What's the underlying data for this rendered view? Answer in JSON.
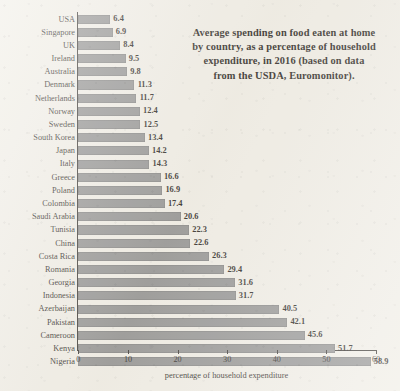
{
  "chart_data": {
    "type": "bar",
    "orientation": "horizontal",
    "title_lines": [
      "Average spending on food eaten at home",
      "by country, as a percentage of household",
      "expenditure, in 2016 (based on data",
      "from the USDA, Euromonitor)."
    ],
    "xlabel": "percentage of household expenditure",
    "ylabel": "",
    "xlim": [
      0,
      60
    ],
    "xticks": [
      0,
      10,
      20,
      30,
      40,
      50,
      60
    ],
    "xtick_labels": [
      "0",
      "10",
      "20",
      "30",
      "40",
      "50",
      "60"
    ],
    "grid": false,
    "legend": false,
    "bar_color": "#8a8a8a",
    "background_color": "#efece4",
    "axis_color": "#2a2622",
    "categories": [
      "USA",
      "Singapore",
      "UK",
      "Ireland",
      "Australia",
      "Denmark",
      "Netherlands",
      "Norway",
      "Sweden",
      "South Korea",
      "Japan",
      "Italy",
      "Greece",
      "Poland",
      "Colombia",
      "Saudi Arabia",
      "Tunisia",
      "China",
      "Costa Rica",
      "Romania",
      "Georgia",
      "Indonesia",
      "Azerbaijan",
      "Pakistan",
      "Cameroon",
      "Kenya",
      "Nigeria"
    ],
    "values": [
      6.4,
      6.9,
      8.4,
      9.5,
      9.8,
      11.3,
      11.7,
      12.4,
      12.5,
      13.4,
      14.2,
      14.3,
      16.6,
      16.9,
      17.4,
      20.6,
      22.3,
      22.6,
      26.3,
      29.4,
      31.6,
      31.7,
      40.5,
      42.1,
      45.6,
      51.7,
      58.9
    ],
    "value_labels": [
      "6.4",
      "6.9",
      "8.4",
      "9.5",
      "9.8",
      "11.3",
      "11.7",
      "12.4",
      "12.5",
      "13.4",
      "14.2",
      "14.3",
      "16.6",
      "16.9",
      "17.4",
      "20.6",
      "22.3",
      "22.6",
      "26.3",
      "29.4",
      "31.6",
      "31.7",
      "40.5",
      "42.1",
      "45.6",
      "51.7",
      "58.9"
    ]
  }
}
